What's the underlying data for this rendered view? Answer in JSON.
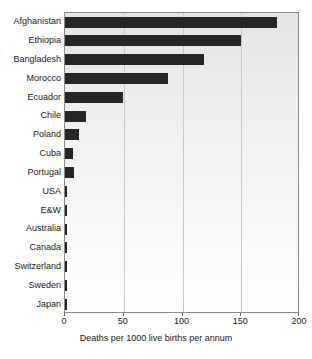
{
  "chart_data": {
    "type": "bar",
    "orientation": "horizontal",
    "title": "",
    "xlabel": "Deaths per 1000 live births per annum",
    "ylabel": "",
    "xlim": [
      0,
      200
    ],
    "xticks": [
      0,
      50,
      100,
      150,
      200
    ],
    "xtick_labels": [
      "0",
      "50",
      "100",
      "150",
      "200"
    ],
    "grid": "vertical",
    "legend": "none",
    "bar_color": "#262626",
    "plot_background": "#eeeeee",
    "categories": [
      "Afghanistan",
      "Ethiopia",
      "Bangladesh",
      "Morocco",
      "Ecuador",
      "Chile",
      "Poland",
      "Cuba",
      "Portugal",
      "USA",
      "E&W",
      "Australia",
      "Canada",
      "Switzerland",
      "Sweden",
      "Japan"
    ],
    "values": [
      180,
      150,
      118,
      88,
      49,
      18,
      12,
      7,
      8,
      2,
      1.5,
      1.5,
      1.5,
      1.5,
      1.5,
      1.5
    ]
  }
}
